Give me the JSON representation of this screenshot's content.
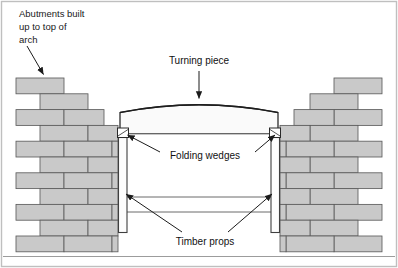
{
  "figure": {
    "background_color": "#ffffff",
    "frame_color": "#b9b9b9",
    "brick_fill": "#c9c9c9",
    "brick_stroke": "#5a5a5a",
    "timber_fill": "#fdfdfd",
    "timber_stroke": "#4a4a4a",
    "arch_fill": "#fafafa",
    "arch_stroke": "#2a2a2a",
    "line_color": "#2b2b2b",
    "text_color": "#1a1a1a"
  },
  "labels": {
    "abutments": {
      "lines": [
        "Abutments built",
        "up to top of",
        "arch"
      ],
      "line1": "Abutments built",
      "line2": "up to top of",
      "line3": "arch"
    },
    "turning_piece": "Turning piece",
    "folding_wedges": "Folding wedges",
    "timber_props": "Timber props"
  },
  "structure": {
    "left_abutment": {
      "name": "left abutment",
      "courses": 11,
      "inner_edge_x": 118,
      "top_y": 78,
      "bottom_y": 252
    },
    "right_abutment": {
      "name": "right abutment",
      "courses": 11,
      "inner_edge_x": 280,
      "top_y": 78,
      "bottom_y": 252
    },
    "turning_piece": {
      "span_left_x": 120,
      "span_right_x": 278,
      "apex_y": 103,
      "springing_y": 133
    },
    "props": {
      "count": 2,
      "left_x": 122,
      "right_x": 276,
      "top_y": 136,
      "bottom_y": 232
    },
    "wedges": {
      "count": 2
    },
    "horizontal_struts": {
      "count": 2,
      "y_values": [
        197,
        212
      ]
    }
  }
}
